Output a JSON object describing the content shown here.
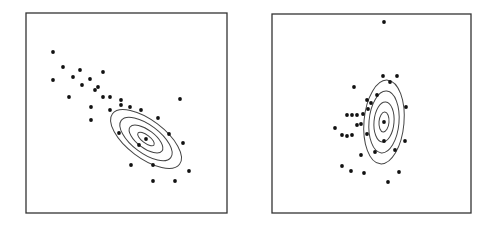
{
  "chart_data": [
    {
      "type": "scatter",
      "title": "",
      "xlabel": "",
      "ylabel": "",
      "grid": false,
      "legend": null,
      "frame": {
        "x": 26,
        "y": 13,
        "w": 201,
        "h": 200
      },
      "points": [
        [
          53,
          52
        ],
        [
          63,
          67
        ],
        [
          80,
          70
        ],
        [
          73,
          77
        ],
        [
          53,
          80
        ],
        [
          90,
          79
        ],
        [
          82,
          85
        ],
        [
          103,
          72
        ],
        [
          98,
          87
        ],
        [
          95,
          90
        ],
        [
          69,
          97
        ],
        [
          103,
          97
        ],
        [
          110,
          97
        ],
        [
          121,
          100
        ],
        [
          121,
          105
        ],
        [
          130,
          107
        ],
        [
          110,
          110
        ],
        [
          91,
          107
        ],
        [
          91,
          120
        ],
        [
          141,
          110
        ],
        [
          158,
          118
        ],
        [
          180,
          99
        ],
        [
          169,
          134
        ],
        [
          119,
          133
        ],
        [
          146,
          139
        ],
        [
          139,
          145
        ],
        [
          183,
          143
        ],
        [
          131,
          165
        ],
        [
          153,
          165
        ],
        [
          189,
          171
        ],
        [
          153,
          181
        ],
        [
          175,
          181
        ]
      ],
      "contours": {
        "center": [
          146,
          139
        ],
        "angle_deg": 37,
        "radii": [
          [
            10,
            4
          ],
          [
            20,
            9
          ],
          [
            31,
            14
          ],
          [
            42,
            19
          ]
        ]
      },
      "annotation": "Gaussian density contours overlaid on scatter; negatively correlated cluster"
    },
    {
      "type": "scatter",
      "title": "",
      "xlabel": "",
      "ylabel": "",
      "grid": false,
      "legend": null,
      "frame": {
        "x": 272,
        "y": 14,
        "w": 199,
        "h": 199
      },
      "points": [
        [
          384,
          22
        ],
        [
          383,
          76
        ],
        [
          397,
          76
        ],
        [
          390,
          82
        ],
        [
          354,
          87
        ],
        [
          377,
          95
        ],
        [
          367,
          100
        ],
        [
          371,
          103
        ],
        [
          368,
          109
        ],
        [
          406,
          107
        ],
        [
          347,
          115
        ],
        [
          352,
          115
        ],
        [
          357,
          115
        ],
        [
          363,
          114
        ],
        [
          384,
          122
        ],
        [
          357,
          125
        ],
        [
          361,
          124
        ],
        [
          335,
          128
        ],
        [
          342,
          135
        ],
        [
          347,
          136
        ],
        [
          352,
          135
        ],
        [
          367,
          134
        ],
        [
          384,
          141
        ],
        [
          405,
          141
        ],
        [
          375,
          152
        ],
        [
          395,
          150
        ],
        [
          361,
          155
        ],
        [
          342,
          166
        ],
        [
          351,
          171
        ],
        [
          364,
          173
        ],
        [
          399,
          172
        ],
        [
          388,
          182
        ]
      ],
      "contours": {
        "center": [
          384,
          122
        ],
        "angle_deg": 95,
        "radii": [
          [
            10,
            5
          ],
          [
            20,
            10
          ],
          [
            31,
            15
          ],
          [
            42,
            20
          ]
        ]
      },
      "annotation": "Gaussian density contours overlaid on scatter; near-vertical elongated cluster"
    }
  ],
  "style": {
    "frame_color": "#333333",
    "point_color": "#111111",
    "contour_color": "#444444"
  }
}
